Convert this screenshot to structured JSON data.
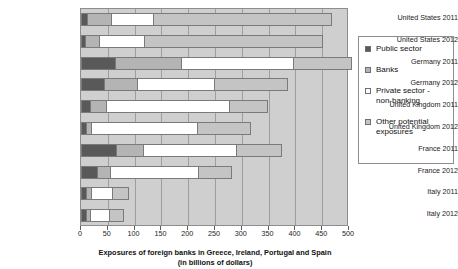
{
  "chart_data": {
    "type": "bar",
    "orientation": "horizontal",
    "stacked": true,
    "title": "",
    "xlabel": "Exposures of foreign banks in Greece, Ireland, Portugal and Spain\n(in billions of dollars)",
    "xlabel_line1": "Exposures of foreign banks in Greece, Ireland, Portugal and Spain",
    "xlabel_line2": "(in billions of dollars)",
    "ylabel": "",
    "xlim": [
      0,
      500
    ],
    "xticks": [
      0,
      50,
      100,
      150,
      200,
      250,
      300,
      350,
      400,
      450,
      500
    ],
    "grid": true,
    "legend_position": "right",
    "categories": [
      "United States 2011",
      "United States 2012",
      "Germany 2011",
      "Germany 2012",
      "United Kingdom 2011",
      "United Kingdom 2012",
      "France 2011",
      "France 2012",
      "Italy 2011",
      "Italy 2012"
    ],
    "series": [
      {
        "name": "Public sector",
        "color": "#595959",
        "values": [
          12,
          8,
          63,
          42,
          17,
          10,
          65,
          29,
          9,
          10
        ]
      },
      {
        "name": "Banks",
        "color": "#b4b4b4",
        "values": [
          44,
          26,
          124,
          63,
          30,
          9,
          51,
          26,
          9,
          6
        ]
      },
      {
        "name": "Private sector - non-banking",
        "color": "#ffffff",
        "values": [
          78,
          84,
          209,
          143,
          229,
          198,
          173,
          164,
          40,
          37
        ]
      },
      {
        "name": "Other potential exposures",
        "color": "#c4c4c4",
        "values": [
          334,
          334,
          109,
          139,
          72,
          100,
          86,
          63,
          32,
          27
        ]
      }
    ],
    "totals": [
      468,
      452,
      505,
      387,
      348,
      317,
      375,
      282,
      90,
      80
    ]
  },
  "legend": {
    "items": [
      {
        "label": "Public sector",
        "swatch": "public-sector-swatch"
      },
      {
        "label": "Banks",
        "swatch": "banks-swatch"
      },
      {
        "label": "Private sector - non-banking",
        "swatch": "private-sector-swatch"
      },
      {
        "label": "Other potential exposures",
        "swatch": "other-exposures-swatch"
      }
    ]
  }
}
